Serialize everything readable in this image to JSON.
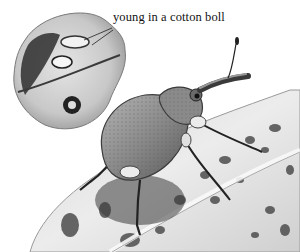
{
  "illustration": {
    "subject": "boll weevil on a leaf",
    "inset_subject": "cotton boll with larvae",
    "label": "young in a cotton boll",
    "palette": {
      "background": "#ffffff",
      "leaf_light": "#e6e6e6",
      "leaf_spots": "#4a4a4a",
      "weevil_body": "#8c8c8c",
      "weevil_dark": "#2a2a2a",
      "boll": "#cfcfcf",
      "label_text": "#111111"
    }
  }
}
